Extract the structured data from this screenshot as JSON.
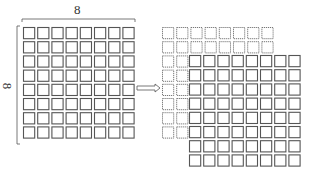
{
  "diagram": {
    "top_label": "8",
    "side_label": "8",
    "left_grid": {
      "rows": 8,
      "cols": 8
    },
    "right_dotted_grid": {
      "rows": 8,
      "cols": 8
    },
    "right_solid_grid": {
      "rows": 8,
      "cols": 8
    },
    "arrow": "right-arrow",
    "colors": {
      "line": "#555555",
      "dotted": "#777777"
    }
  }
}
